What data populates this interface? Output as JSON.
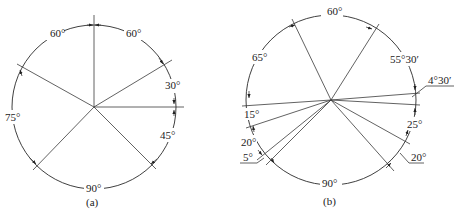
{
  "figure_a": {
    "caption": "(a)",
    "angles": [
      {
        "label": "60°",
        "position": "upper-left"
      },
      {
        "label": "60°",
        "position": "upper-right"
      },
      {
        "label": "30°",
        "position": "right"
      },
      {
        "label": "45°",
        "position": "lower-right"
      },
      {
        "label": "90°",
        "position": "bottom"
      },
      {
        "label": "75°",
        "position": "left"
      }
    ]
  },
  "figure_b": {
    "caption": "(b)",
    "angles": [
      {
        "label": "60°",
        "position": "top"
      },
      {
        "label": "55°30′",
        "position": "upper-right"
      },
      {
        "label": "4°30′",
        "position": "right-leader"
      },
      {
        "label": "25°",
        "position": "lower-right"
      },
      {
        "label": "20°",
        "position": "lower-right-leader"
      },
      {
        "label": "90°",
        "position": "bottom"
      },
      {
        "label": "5°",
        "position": "lower-left-leader"
      },
      {
        "label": "20°",
        "position": "left-lower"
      },
      {
        "label": "15°",
        "position": "left"
      },
      {
        "label": "65°",
        "position": "upper-left"
      }
    ]
  }
}
